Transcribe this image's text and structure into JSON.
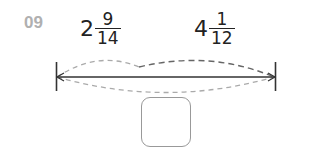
{
  "question": {
    "number": "09"
  },
  "segments": [
    {
      "whole": "2",
      "numerator": "9",
      "denominator": "14"
    },
    {
      "whole": "4",
      "numerator": "1",
      "denominator": "12"
    }
  ],
  "answer_box": {
    "value": ""
  },
  "colors": {
    "label_gray": "#b0b0b0",
    "line": "#333333",
    "dash_light": "#aaaaaa",
    "dash_dark": "#666666",
    "box_border": "#999999"
  }
}
